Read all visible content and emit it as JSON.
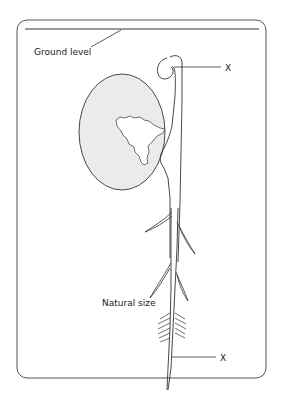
{
  "diagram": {
    "labels": {
      "ground_level": "Ground level",
      "natural_size": "Natural size",
      "x_top": "X",
      "x_bottom": "X"
    },
    "colors": {
      "line": "#333333",
      "seed_fill": "#ebebeb",
      "frame": "#555555"
    }
  }
}
